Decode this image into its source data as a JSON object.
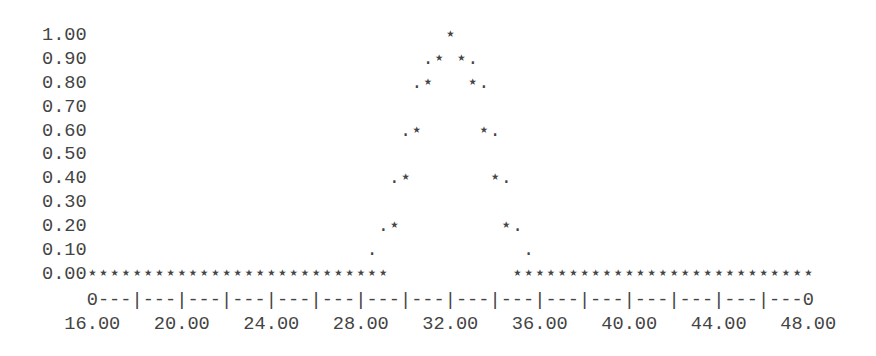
{
  "chart_data": {
    "type": "scatter",
    "style": "ascii line-printer plot",
    "title": "",
    "xlabel": "",
    "ylabel": "",
    "xlim": [
      16,
      48
    ],
    "ylim": [
      0,
      1
    ],
    "x_ticks": [
      "16.00",
      "20.00",
      "24.00",
      "28.00",
      "32.00",
      "36.00",
      "40.00",
      "44.00",
      "48.00"
    ],
    "y_ticks": [
      "1.00",
      "0.90",
      "0.80",
      "0.70",
      "0.60",
      "0.50",
      "0.40",
      "0.30",
      "0.20",
      "0.10",
      "0.00"
    ],
    "marker": "*",
    "grid": false,
    "x": [
      16,
      16.5,
      17,
      17.5,
      18,
      18.5,
      19,
      19.5,
      20,
      20.5,
      21,
      21.5,
      22,
      22.5,
      23,
      23.5,
      24,
      24.5,
      25,
      25.5,
      26,
      26.5,
      27,
      27.5,
      28,
      28.5,
      29,
      29.5,
      30,
      30.5,
      31,
      31.5,
      32,
      32.5,
      33,
      33.5,
      34,
      34.5,
      35,
      35.5,
      36,
      36.5,
      37,
      37.5,
      38,
      38.5,
      39,
      39.5,
      40,
      40.5,
      41,
      41.5,
      42,
      42.5,
      43,
      43.5,
      44,
      44.5,
      45,
      45.5,
      46,
      46.5,
      47,
      47.5,
      48
    ],
    "values": [
      0,
      0,
      0,
      0,
      0,
      0,
      0,
      0,
      0,
      0,
      0,
      0,
      0,
      0,
      0,
      0,
      0,
      0,
      0,
      0,
      0,
      0,
      0,
      0,
      0,
      0,
      0,
      0.2,
      0.4,
      0.6,
      0.8,
      0.9,
      1.0,
      0.9,
      0.8,
      0.6,
      0.4,
      0.2,
      0,
      0,
      0,
      0,
      0,
      0,
      0,
      0,
      0,
      0,
      0,
      0,
      0,
      0,
      0,
      0,
      0,
      0,
      0,
      0,
      0,
      0,
      0,
      0,
      0,
      0,
      0
    ]
  },
  "rows": [
    {
      "label": "1.00",
      "cells": "                                *"
    },
    {
      "label": "0.90",
      "cells": "                              .* *."
    },
    {
      "label": "0.80",
      "cells": "                             .*   *."
    },
    {
      "label": "0.70",
      "cells": ""
    },
    {
      "label": "0.60",
      "cells": "                            .*     *."
    },
    {
      "label": "0.50",
      "cells": ""
    },
    {
      "label": "0.40",
      "cells": "                           .*       *."
    },
    {
      "label": "0.30",
      "cells": ""
    },
    {
      "label": "0.20",
      "cells": "                          .*         *."
    },
    {
      "label": "0.10",
      "cells": "                         .             ."
    },
    {
      "label": "0.00",
      "cells": "***************************           ***************************"
    }
  ],
  "x_axis": {
    "line": "    0---|---|---|---|---|---|---|---|---|---|---|---|---|---|---|---0",
    "labels": "  16.00   20.00   24.00   28.00   32.00   36.00   40.00   44.00   48.00"
  }
}
